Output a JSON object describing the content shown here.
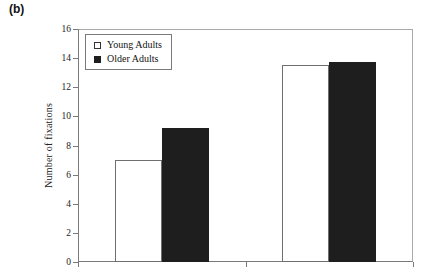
{
  "figure_label": "(b)",
  "chart_data": {
    "type": "bar",
    "title": "",
    "xlabel": "",
    "ylabel": "Number of fixations",
    "categories": [
      "",
      ""
    ],
    "series": [
      {
        "name": "Young Adults",
        "values": [
          7.0,
          13.5
        ],
        "fill": "#ffffff",
        "border": "#6f6f6f"
      },
      {
        "name": "Older Adults",
        "values": [
          9.2,
          13.7
        ],
        "fill": "#1e1e1e",
        "border": "#1e1e1e"
      }
    ],
    "ylim": [
      0,
      16
    ],
    "yticks": [
      0,
      2,
      4,
      6,
      8,
      10,
      12,
      14,
      16
    ],
    "grid": false,
    "legend_position": "top-left-inside",
    "x_tick_marks": 3
  },
  "colors": {
    "background": "#ffffff",
    "axis_line": "#7a7a7a",
    "plot_frame": "#a9a9a9",
    "tick_text": "#222222"
  }
}
